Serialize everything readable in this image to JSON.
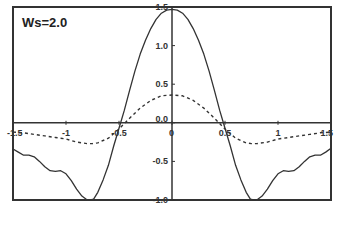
{
  "chart_data": {
    "type": "line",
    "title": "",
    "annotation": "Ws=2.0",
    "xlabel": "",
    "ylabel": "",
    "xlim": [
      -1.5,
      1.5
    ],
    "ylim": [
      -1.0,
      1.5
    ],
    "grid": false,
    "legend": null,
    "x_ticks": [
      -1.5,
      -1,
      -0.5,
      0,
      0.5,
      1,
      1.5
    ],
    "x_tick_labels": [
      "-1.5",
      "-1",
      "-0.5",
      "0",
      "0.5",
      "1",
      "1.5"
    ],
    "y_ticks": [
      1.5,
      1.0,
      0.5,
      0.0,
      -0.5,
      -1.0
    ],
    "y_tick_labels": [
      "1.5",
      "1.0",
      "0.5",
      "0.0",
      "-0.5",
      "-1.0"
    ],
    "series": [
      {
        "name": "solid",
        "style": "solid",
        "color": "#333333",
        "x": [
          -1.5,
          -1.45,
          -1.4,
          -1.35,
          -1.3,
          -1.25,
          -1.2,
          -1.15,
          -1.1,
          -1.05,
          -1.0,
          -0.95,
          -0.9,
          -0.85,
          -0.8,
          -0.77,
          -0.74,
          -0.7,
          -0.65,
          -0.6,
          -0.55,
          -0.5,
          -0.45,
          -0.4,
          -0.35,
          -0.3,
          -0.25,
          -0.2,
          -0.15,
          -0.1,
          -0.05,
          0.0,
          0.05,
          0.1,
          0.15,
          0.2,
          0.25,
          0.3,
          0.35,
          0.4,
          0.45,
          0.5,
          0.55,
          0.6,
          0.65,
          0.7,
          0.74,
          0.77,
          0.8,
          0.85,
          0.9,
          0.95,
          1.0,
          1.05,
          1.1,
          1.15,
          1.2,
          1.25,
          1.3,
          1.35,
          1.4,
          1.45,
          1.5
        ],
        "y": [
          -0.34,
          -0.38,
          -0.42,
          -0.42,
          -0.44,
          -0.5,
          -0.57,
          -0.62,
          -0.63,
          -0.62,
          -0.66,
          -0.75,
          -0.86,
          -0.95,
          -1.0,
          -1.0,
          -0.99,
          -0.9,
          -0.74,
          -0.55,
          -0.3,
          -0.07,
          0.16,
          0.42,
          0.67,
          0.89,
          1.07,
          1.22,
          1.34,
          1.42,
          1.46,
          1.47,
          1.46,
          1.42,
          1.34,
          1.22,
          1.07,
          0.89,
          0.67,
          0.42,
          0.16,
          -0.07,
          -0.3,
          -0.55,
          -0.74,
          -0.9,
          -0.99,
          -1.0,
          -1.0,
          -0.95,
          -0.86,
          -0.75,
          -0.66,
          -0.62,
          -0.63,
          -0.62,
          -0.57,
          -0.5,
          -0.44,
          -0.42,
          -0.42,
          -0.38,
          -0.33
        ]
      },
      {
        "name": "dotted",
        "style": "dashed",
        "color": "#333333",
        "x": [
          -1.5,
          -1.4,
          -1.3,
          -1.2,
          -1.1,
          -1.0,
          -0.9,
          -0.8,
          -0.75,
          -0.7,
          -0.6,
          -0.5,
          -0.4,
          -0.3,
          -0.2,
          -0.1,
          0.0,
          0.1,
          0.2,
          0.3,
          0.4,
          0.5,
          0.6,
          0.7,
          0.75,
          0.8,
          0.9,
          1.0,
          1.1,
          1.2,
          1.3,
          1.4,
          1.5
        ],
        "y": [
          -0.12,
          -0.13,
          -0.15,
          -0.17,
          -0.19,
          -0.21,
          -0.25,
          -0.27,
          -0.27,
          -0.26,
          -0.2,
          -0.08,
          0.06,
          0.19,
          0.29,
          0.35,
          0.36,
          0.35,
          0.29,
          0.19,
          0.06,
          -0.08,
          -0.2,
          -0.26,
          -0.27,
          -0.27,
          -0.25,
          -0.21,
          -0.19,
          -0.17,
          -0.15,
          -0.13,
          -0.12
        ]
      }
    ]
  }
}
